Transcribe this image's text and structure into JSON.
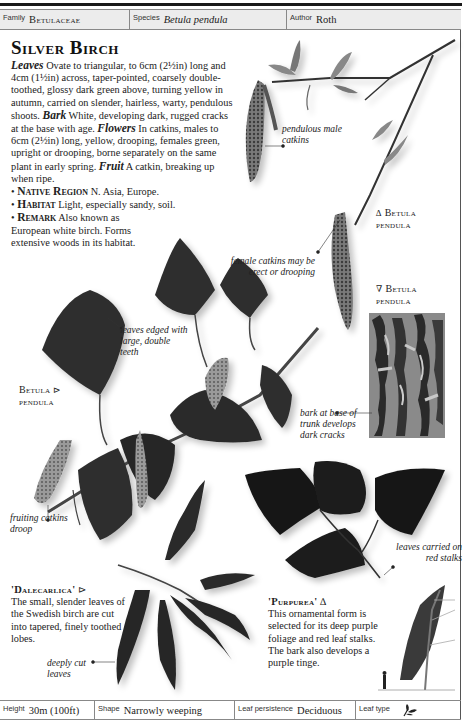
{
  "header": {
    "family_label": "Family",
    "family_value": "Betulaceae",
    "species_label": "Species",
    "species_value": "Betula pendula",
    "author_label": "Author",
    "author_value": "Roth"
  },
  "title": "Silver Birch",
  "description": {
    "leaves_key": "Leaves",
    "leaves_text": " Ovate to triangular, to 6cm (2½in) long and 4cm (1½in) across, taper-pointed, coarsely double-toothed, glossy dark green above, turning yellow in autumn, carried on slender, hairless, warty, pendulous shoots. ",
    "bark_key": "Bark",
    "bark_text": " White, developing dark, rugged cracks at the base with age. ",
    "flowers_key": "Flowers",
    "flowers_text": " In catkins, males to 6cm (2½in) long, yellow, drooping, females green, upright or drooping, borne separately on the same plant in early spring. ",
    "fruit_key": "Fruit",
    "fruit_text": " A catkin, breaking up when ripe.",
    "bullets": [
      {
        "key": "Native Region",
        "text": " N. Asia, Europe."
      },
      {
        "key": "Habitat",
        "text": " Light, especially sandy, soil."
      },
      {
        "key": "Remark",
        "text": " Also known as European white birch. Forms extensive woods in its habitat."
      }
    ]
  },
  "captions": {
    "male_catkins": "pendulous male catkins",
    "female_catkins": "female catkins may be erect or drooping",
    "leaves_edged": "leaves edged with large, double teeth",
    "bark": "bark at base of trunk develops dark cracks",
    "fruiting_catkins": "fruiting catkins droop",
    "red_stalks": "leaves carried on red stalks",
    "deeply_cut": "deeply cut leaves"
  },
  "plate_labels": {
    "shoot": {
      "arrow": "∆",
      "name": "Betula",
      "sub": "pendula"
    },
    "bark": {
      "arrow": "∇",
      "name": "Betula",
      "sub": "pendula"
    },
    "branch": {
      "arrow": "⊳",
      "name": "Betula",
      "sub": "pendula"
    }
  },
  "cultivars": [
    {
      "name": "'Dalecarlica'",
      "arrow": "⊳",
      "text": "The small, slender leaves of the Swedish birch are cut into tapered, finely toothed lobes."
    },
    {
      "name": "'Purpurea'",
      "arrow": "∆",
      "text": "This ornamental form is selected for its deep purple foliage and red leaf stalks. The bark also develops a purple tinge."
    }
  ],
  "footer": {
    "height_label": "Height",
    "height_value": "30m (100ft)",
    "shape_label": "Shape",
    "shape_value": "Narrowly weeping",
    "persistence_label": "Leaf persistence",
    "persistence_value": "Deciduous",
    "leaf_type_label": "Leaf type",
    "leaf_type_icon": "leaf-icon"
  },
  "colors": {
    "header_bg": "#ececec",
    "leaf_dark": "#2b2b2b",
    "purple_leaf": "#161616",
    "catkin": "#6a6a6a"
  }
}
